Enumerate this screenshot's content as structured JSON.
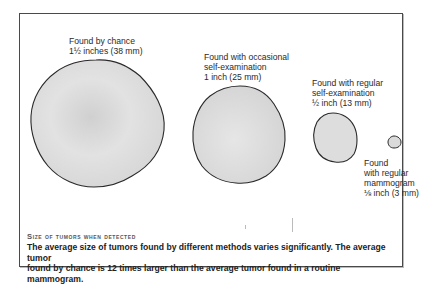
{
  "figure": {
    "items": [
      {
        "label_line1": "Found by chance",
        "label_line2": "1½ inches (38 mm)",
        "label_line3": ""
      },
      {
        "label_line1": "Found with occasional",
        "label_line2": "self-examination",
        "label_line3": "1 inch (25 mm)"
      },
      {
        "label_line1": "Found with regular",
        "label_line2": "self-examination",
        "label_line3": "½ inch (13 mm)"
      },
      {
        "label_line1": "Found",
        "label_line2": "with regular",
        "label_line3": "mammogram",
        "label_line4": "⅛ inch (3 mm)"
      }
    ],
    "caption_title": "Size of tumors when detected",
    "caption_body_line1": "The average size of tumors found by different methods varies significantly. The average tumor",
    "caption_body_line2": "found by chance is 12 times larger than the average tumor found in a routine mammogram."
  },
  "colors": {
    "tumor_fill": "#dcdcdc",
    "tumor_outline": "#2a2a2a",
    "frame_border": "#4a4a4a"
  }
}
